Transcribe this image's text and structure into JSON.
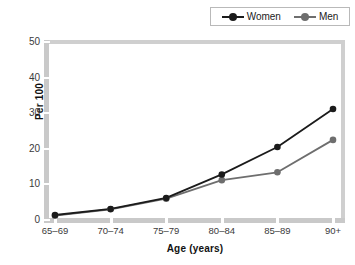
{
  "chart_data": {
    "type": "line",
    "title": "",
    "xlabel": "Age (years)",
    "ylabel": "Per 100",
    "categories": [
      "65–69",
      "70–74",
      "75–79",
      "80–84",
      "85–89",
      "90+"
    ],
    "series": [
      {
        "name": "Women",
        "color": "#1b1b1b",
        "marker": "circle",
        "values": [
          1.4,
          3.1,
          6.2,
          12.8,
          20.5,
          31.2
        ]
      },
      {
        "name": "Men",
        "color": "#6e6e6e",
        "marker": "circle",
        "values": [
          1.2,
          3.0,
          6.0,
          11.2,
          13.4,
          22.5
        ]
      }
    ],
    "ylim": [
      0,
      50
    ],
    "yticks": [
      0,
      10,
      20,
      30,
      40,
      50
    ],
    "ytick_labels": [
      "0",
      "10",
      "20",
      "30",
      "40",
      "50"
    ],
    "grid": false,
    "legend_position": "top-right",
    "plot_background": "#ffffff",
    "axis_color": "#c9c9c9"
  },
  "legend": {
    "entries": [
      {
        "label": "Women",
        "color": "#1b1b1b"
      },
      {
        "label": "Men",
        "color": "#6e6e6e"
      }
    ]
  },
  "axes": {
    "y_title": "Per 100",
    "x_title": "Age (years)"
  }
}
